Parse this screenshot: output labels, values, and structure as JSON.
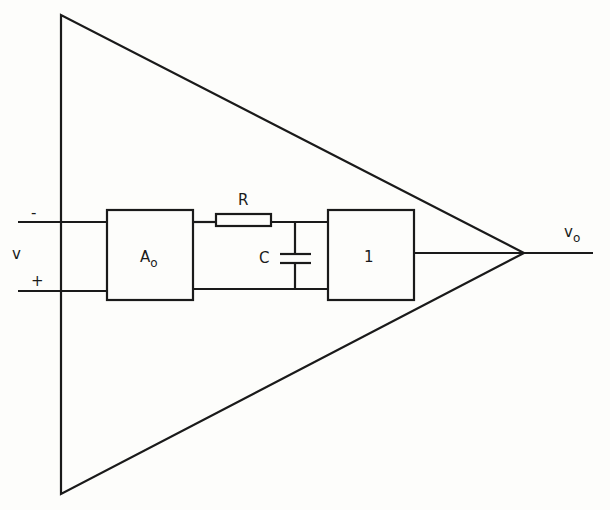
{
  "diagram": {
    "labels": {
      "minus": "-",
      "plus": "+",
      "v_in": "v",
      "gain_block": "A",
      "gain_block_sub": "o",
      "resistor": "R",
      "capacitor": "C",
      "buffer_block": "1",
      "v_out": "v",
      "v_out_sub": "o"
    },
    "colors": {
      "stroke": "#1a1a1a",
      "background": "#fdfdfb"
    }
  }
}
